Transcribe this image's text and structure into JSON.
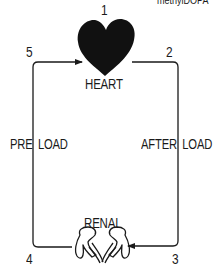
{
  "diagram": {
    "top_right_caption": "methylDOPA",
    "nodes": {
      "heart": {
        "label": "HEART",
        "icon": "heart-icon"
      },
      "renal": {
        "label": "RENAL",
        "icon": "kidneys-icon"
      }
    },
    "edges": {
      "left": {
        "label": "PRE LOAD",
        "direction": "up-then-right-into-heart"
      },
      "right": {
        "label": "AFTER LOAD",
        "direction": "down-then-left-into-kidneys"
      }
    },
    "step_numbers": {
      "n1": "1",
      "n2": "2",
      "n3": "3",
      "n4": "4",
      "n5": "5"
    },
    "colors": {
      "ink": "#1a1a1a",
      "background": "#ffffff"
    }
  }
}
